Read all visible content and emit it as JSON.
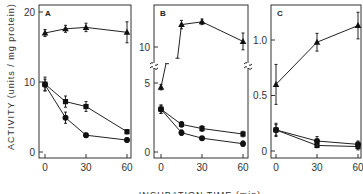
{
  "chart_data": [
    {
      "type": "line",
      "panel": "A",
      "xlabel": "INCUBATION TIME (min)",
      "ylabel": "ACTIVITY (units / mg protein)",
      "ylim": [
        0,
        20
      ],
      "xlim": [
        0,
        60
      ],
      "x_ticks": [
        0,
        30,
        60
      ],
      "y_ticks": [
        0,
        10,
        20
      ],
      "y_tick_labels": [
        "0",
        "10",
        "20"
      ],
      "x_tick_labels": [
        "0",
        "30",
        "60"
      ],
      "series": [
        {
          "name": "triangles",
          "marker": "triangle",
          "x": [
            0,
            15,
            30,
            60
          ],
          "y": [
            17.0,
            17.6,
            17.8,
            17.1
          ],
          "err": [
            0.5,
            0.5,
            0.6,
            1.5
          ]
        },
        {
          "name": "squares",
          "marker": "square",
          "x": [
            0,
            15,
            30,
            60
          ],
          "y": [
            9.7,
            7.2,
            6.5,
            2.9
          ],
          "err": [
            1.0,
            0.8,
            0.7,
            0.3
          ]
        },
        {
          "name": "circles",
          "marker": "circle",
          "x": [
            0,
            15,
            30,
            60
          ],
          "y": [
            9.6,
            4.9,
            2.4,
            1.7
          ],
          "err": [
            0.8,
            0.8,
            0.3,
            0.3
          ]
        }
      ]
    },
    {
      "type": "line",
      "panel": "B",
      "ylim": [
        0,
        12.5
      ],
      "xlim": [
        0,
        60
      ],
      "axis_break": [
        6.5,
        9
      ],
      "x_ticks": [
        0,
        30,
        60
      ],
      "y_ticks": [
        0,
        5,
        10
      ],
      "y_tick_labels": [
        "0",
        "5",
        "10"
      ],
      "x_tick_labels": [
        "0",
        "30",
        "60"
      ],
      "series": [
        {
          "name": "triangles",
          "marker": "triangle",
          "x": [
            0,
            15,
            30,
            60
          ],
          "y": [
            4.7,
            11.6,
            11.8,
            10.4
          ],
          "err": [
            0.2,
            0.3,
            0.2,
            0.6
          ]
        },
        {
          "name": "squares",
          "marker": "square",
          "x": [
            0,
            15,
            30,
            60
          ],
          "y": [
            3.1,
            2.0,
            1.7,
            1.3
          ],
          "err": [
            0.3,
            0.2,
            0.2,
            0.2
          ]
        },
        {
          "name": "circles",
          "marker": "circle",
          "x": [
            0,
            15,
            30,
            60
          ],
          "y": [
            3.1,
            1.4,
            1.0,
            0.6
          ],
          "err": [
            0.3,
            0.2,
            0.1,
            0.2
          ]
        }
      ]
    },
    {
      "type": "line",
      "panel": "C",
      "ylim": [
        0,
        1.25
      ],
      "xlim": [
        0,
        60
      ],
      "x_ticks": [
        0,
        30,
        60
      ],
      "y_ticks": [
        0,
        0.5,
        1.0
      ],
      "y_tick_labels": [
        "0",
        "0.5",
        "1.0"
      ],
      "x_tick_labels": [
        "0",
        "30",
        "60"
      ],
      "series": [
        {
          "name": "triangles",
          "marker": "triangle",
          "x": [
            0,
            30,
            60
          ],
          "y": [
            0.6,
            0.98,
            1.13
          ],
          "err": [
            0.18,
            0.08,
            0.12
          ]
        },
        {
          "name": "squares",
          "marker": "square",
          "x": [
            0,
            30,
            60
          ],
          "y": [
            0.19,
            0.05,
            0.04
          ],
          "err": [
            0.05,
            0.02,
            0.03
          ]
        },
        {
          "name": "circles",
          "marker": "circle",
          "x": [
            0,
            30,
            60
          ],
          "y": [
            0.19,
            0.09,
            0.06
          ],
          "err": [
            0.06,
            0.04,
            0.03
          ]
        }
      ]
    }
  ]
}
